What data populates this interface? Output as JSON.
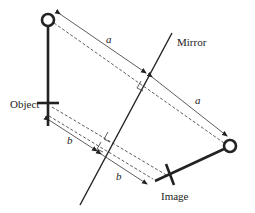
{
  "diagram": {
    "type": "plane-mirror-reflection",
    "labels": {
      "mirror": "Mirror",
      "object": "Object",
      "image": "Image"
    },
    "distances": {
      "top_object_to_mirror": "a",
      "mirror_to_top_image": "a",
      "bottom_object_to_mirror": "b",
      "mirror_to_bottom_image": "b"
    },
    "colors": {
      "stroke": "#222222",
      "background": "#ffffff"
    }
  }
}
